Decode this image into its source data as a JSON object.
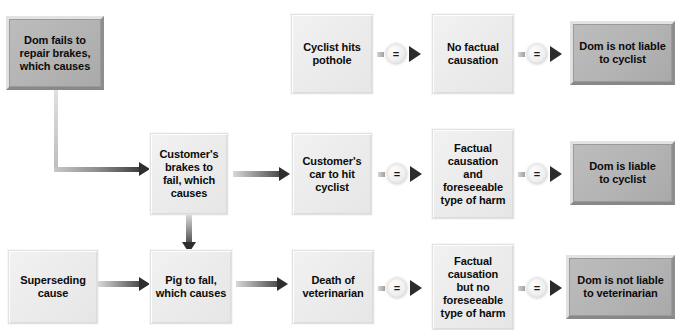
{
  "diagram": {
    "colors": {
      "light_box": "#ececec",
      "dark_box": "#b4b4b4",
      "arrow": "#2e2e2e",
      "text": "#0b0b0b",
      "background": "#ffffff"
    },
    "equals_symbol": "=",
    "nodes": {
      "dom_fails": "Dom fails to\nrepair brakes,\nwhich causes",
      "cyclist_pothole": "Cyclist hits\npothole",
      "no_factual_causation": "No factual\ncausation",
      "not_liable_cyclist": "Dom is not liable\nto cyclist",
      "customer_brakes": "Customer's\nbrakes to\nfail, which\ncauses",
      "customer_car_hits": "Customer's\ncar to hit\ncyclist",
      "factual_and_foreseeable": "Factual\ncausation\nand\nforeseeable\ntype of harm",
      "liable_cyclist": "Dom is liable\nto cyclist",
      "superseding_cause": "Superseding\ncause",
      "pig_to_fall": "Pig to fall,\nwhich causes",
      "death_vet": "Death of\nveterinarian",
      "factual_no_foreseeable": "Factual\ncausation\nbut no\nforeseeable\ntype of harm",
      "not_liable_vet": "Dom is not liable\nto veterinarian"
    },
    "rows": [
      {
        "name": "top-row",
        "chain": [
          "cyclist_pothole",
          "no_factual_causation",
          "not_liable_cyclist"
        ]
      },
      {
        "name": "middle-row",
        "chain": [
          "customer_brakes",
          "customer_car_hits",
          "factual_and_foreseeable",
          "liable_cyclist"
        ]
      },
      {
        "name": "bottom-row",
        "chain": [
          "superseding_cause",
          "pig_to_fall",
          "death_vet",
          "factual_no_foreseeable",
          "not_liable_vet"
        ]
      }
    ]
  }
}
